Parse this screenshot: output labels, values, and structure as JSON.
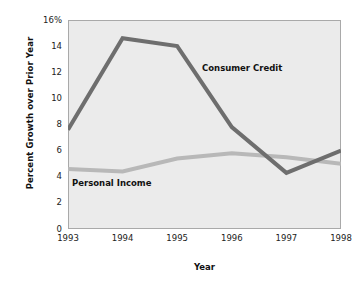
{
  "chart_data": {
    "type": "line",
    "title": "",
    "xlabel": "Year",
    "ylabel": "Percent Growth over Prior Year",
    "categories": [
      "1993",
      "1994",
      "1995",
      "1996",
      "1997",
      "1998"
    ],
    "x": [
      1993,
      1994,
      1995,
      1996,
      1997,
      1998
    ],
    "xlim": [
      1993,
      1998
    ],
    "ylim": [
      0,
      16
    ],
    "yticks": [
      0,
      2,
      4,
      6,
      8,
      10,
      12,
      14,
      16
    ],
    "ytick_labels": [
      "0",
      "2",
      "4",
      "6",
      "8",
      "10",
      "12",
      "14",
      "16%"
    ],
    "xtick_labels": [
      "1993",
      "1994",
      "1995",
      "1996",
      "1997",
      "1998"
    ],
    "grid": false,
    "legend_position": "inline-annotation",
    "series": [
      {
        "name": "Consumer Credit",
        "color": "#6e6e6e",
        "values": [
          7.6,
          14.6,
          14.0,
          7.8,
          4.3,
          6.0
        ]
      },
      {
        "name": "Personal Income",
        "color": "#b8b8b8",
        "values": [
          4.6,
          4.4,
          5.4,
          5.8,
          5.5,
          5.0
        ]
      }
    ],
    "annotations": [
      {
        "text": "Consumer Credit",
        "series": "Consumer Credit"
      },
      {
        "text": "Personal Income",
        "series": "Personal Income"
      }
    ],
    "plot_background": "#ebebeb",
    "figure_background": "#ffffff",
    "axis_color": "#a9a9a9"
  },
  "axes": {
    "y_title": "Percent Growth over Prior Year",
    "x_title": "Year"
  }
}
